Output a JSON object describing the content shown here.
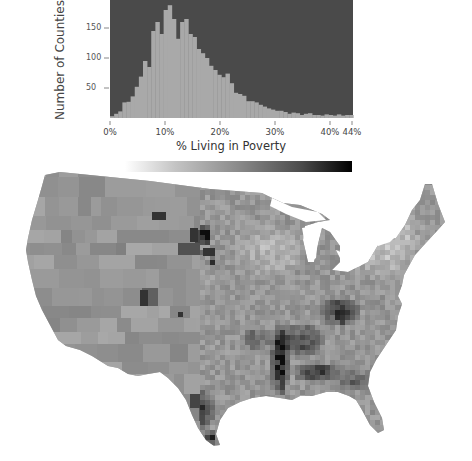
{
  "chart_data": [
    {
      "type": "bar",
      "subtype": "histogram",
      "title": "",
      "xlabel": "% Living in Poverty",
      "ylabel": "Number of Counties",
      "x_ticks": [
        "0%",
        "10%",
        "20%",
        "30%",
        "40%",
        "44%"
      ],
      "x_tick_values": [
        0,
        10,
        20,
        30,
        40,
        44
      ],
      "y_ticks": [
        "50",
        "100",
        "150"
      ],
      "y_tick_values": [
        50,
        100,
        150
      ],
      "xlim": [
        0,
        44
      ],
      "ylim": [
        0,
        195
      ],
      "bin_width": 0.75,
      "bin_start": 0,
      "values": [
        3,
        7,
        11,
        26,
        27,
        36,
        52,
        69,
        95,
        85,
        145,
        160,
        140,
        180,
        188,
        165,
        132,
        160,
        165,
        140,
        135,
        115,
        108,
        100,
        87,
        80,
        72,
        68,
        74,
        58,
        42,
        40,
        37,
        28,
        28,
        26,
        22,
        19,
        16,
        14,
        12,
        12,
        10,
        7,
        9,
        8,
        5,
        7,
        8,
        5,
        5,
        4,
        6,
        5,
        4,
        6,
        4,
        5,
        5
      ],
      "colors": {
        "background": "#4a4a4a",
        "bars": "#a9a9a9"
      },
      "grid": false,
      "legend": null
    },
    {
      "type": "heatmap",
      "subtype": "choropleth",
      "title": "",
      "region": "Contiguous United States, by county",
      "value_label": "% Living in Poverty",
      "colorscale": {
        "min": 0,
        "max": 44,
        "min_color": "#ffffff",
        "max_color": "#000000",
        "kind": "grayscale"
      },
      "highlights": [
        "Darkest counties: Mississippi Delta, Black Belt of Alabama/Georgia, eastern Kentucky/Appalachia, South Dakota reservations, Texas-Mexico border, Four Corners / Navajo region",
        "Lighter counties: Northeast, upper Midwest, suburban areas"
      ]
    }
  ],
  "histogram": {
    "ylabel": "Number of Counties",
    "xlabel": "% Living in Poverty",
    "y_ticks": [
      {
        "label": "150",
        "y": 28
      },
      {
        "label": "100",
        "y": 58
      },
      {
        "label": "50",
        "y": 88
      }
    ],
    "x_ticks": [
      {
        "label": "0%",
        "x": 110
      },
      {
        "label": "10%",
        "x": 165
      },
      {
        "label": "20%",
        "x": 220
      },
      {
        "label": "30%",
        "x": 275
      },
      {
        "label": "40%",
        "x": 330
      },
      {
        "label": "44%",
        "x": 352
      }
    ]
  },
  "colorbar": {
    "start": "#ffffff",
    "end": "#000000"
  }
}
